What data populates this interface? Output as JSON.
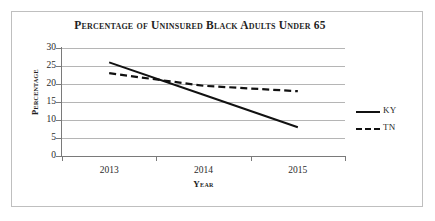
{
  "chart_data": {
    "type": "line",
    "title": "Percentage of Uninsured Black Adults Under 65",
    "xlabel": "Year",
    "ylabel": "Percentage",
    "categories": [
      "2013",
      "2014",
      "2015"
    ],
    "series": [
      {
        "name": "KY",
        "values": [
          26,
          17,
          8
        ],
        "style": "solid"
      },
      {
        "name": "TN",
        "values": [
          23,
          19.5,
          18
        ],
        "style": "dashed"
      }
    ],
    "ylim": [
      0,
      30
    ],
    "yticks": [
      0,
      5,
      10,
      15,
      20,
      25,
      30
    ],
    "ytick_labels": [
      "0",
      "5",
      "10",
      "15",
      "20",
      "25",
      "30"
    ],
    "grid": "horizontal",
    "legend_position": "right",
    "line_color": "#111111"
  },
  "legend": {
    "entries": [
      {
        "label": "KY",
        "style": "solid"
      },
      {
        "label": "TN",
        "style": "dashed"
      }
    ]
  }
}
